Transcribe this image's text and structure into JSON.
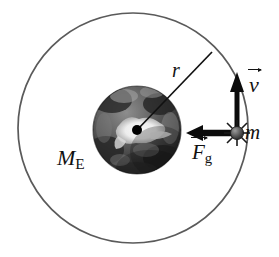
{
  "figure": {
    "type": "physics-diagram",
    "background_color": "#ffffff",
    "ink_color": "#111111",
    "orbit_color": "#5a5a5a"
  },
  "orbit": {
    "name": "orbit-circle",
    "center_x": 133,
    "center_y": 128,
    "radius": 115,
    "stroke_width": 1.6,
    "color": "#5a5a5a"
  },
  "earth": {
    "name": "earth-sphere",
    "center_x": 137,
    "center_y": 130,
    "radius": 44,
    "label": "M",
    "label_subscript": "E",
    "surface_colors": [
      "#1b1b1b",
      "#3d3d3d",
      "#6e6e6e",
      "#9a9a9a",
      "#d8d8d8",
      "#ffffff"
    ]
  },
  "center_marker": {
    "name": "earth-center-dot",
    "x": 137,
    "y": 130,
    "radius": 5,
    "color": "#000000"
  },
  "radius_line": {
    "name": "radius-line",
    "label": "r",
    "from_x": 137,
    "from_y": 130,
    "to_x": 212,
    "to_y": 52,
    "stroke_width": 1.6
  },
  "satellite": {
    "name": "satellite-mass",
    "label": "m",
    "x": 237,
    "y": 133,
    "radius": 6,
    "color": "#4a4a4a",
    "has_sparkle_rays": true
  },
  "velocity_vector": {
    "name": "velocity-arrow",
    "label": "v",
    "direction": "up",
    "tail_x": 237,
    "tail_y": 133,
    "head_x": 237,
    "head_y": 74,
    "stroke_width": 5
  },
  "force_vector": {
    "name": "gravitational-force-arrow",
    "label": "F",
    "label_subscript": "g",
    "direction": "left",
    "tail_x": 237,
    "tail_y": 133,
    "head_x": 188,
    "head_y": 133,
    "stroke_width": 6
  },
  "labels": {
    "earth_mass": "M",
    "earth_mass_sub": "E",
    "radius": "r",
    "velocity": "v",
    "force": "F",
    "force_sub": "g",
    "satellite_mass": "m"
  }
}
